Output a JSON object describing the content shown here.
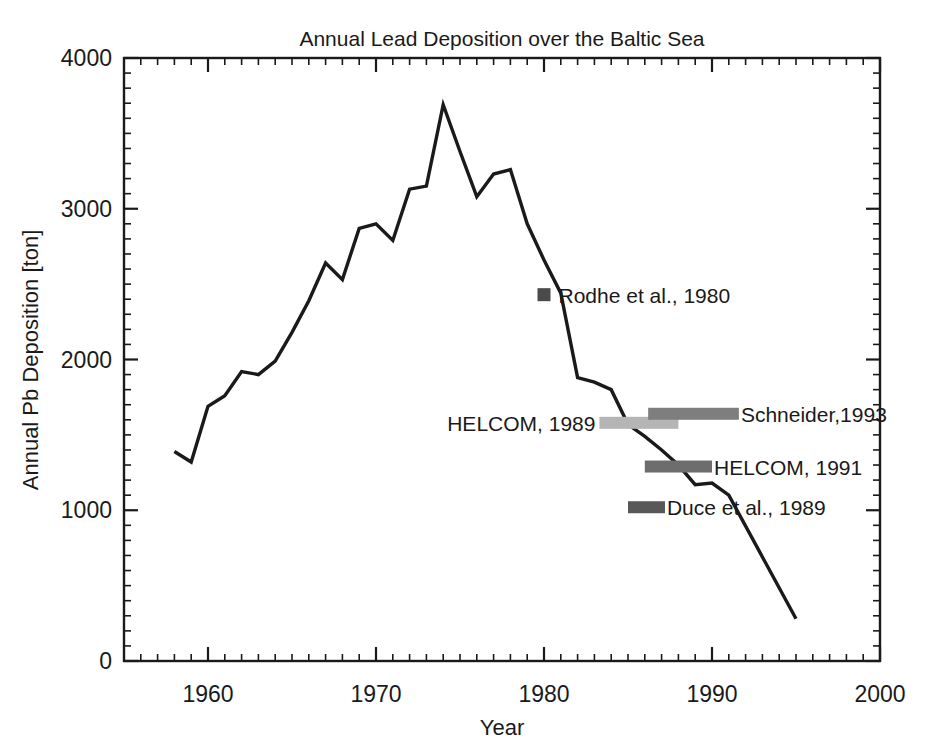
{
  "chart_data": {
    "type": "line",
    "title": "Annual Lead Deposition over the Baltic Sea",
    "xlabel": "Year",
    "ylabel": "Annual Pb Deposition [ton]",
    "xlim": [
      1955,
      2000
    ],
    "ylim": [
      0,
      4000
    ],
    "x_major_ticks": [
      1960,
      1970,
      1980,
      1990,
      2000
    ],
    "x_major_tick_labels": [
      "1960",
      "1970",
      "1980",
      "1990",
      "2000"
    ],
    "x_minor_tick_interval": 1,
    "y_major_ticks": [
      0,
      1000,
      2000,
      3000,
      4000
    ],
    "y_major_tick_labels": [
      "0",
      "1000",
      "2000",
      "3000",
      "4000"
    ],
    "y_minor_tick_interval": 100,
    "grid": false,
    "legend": "inline-annotations",
    "line_color": "#1a1a1a",
    "series": [
      {
        "name": "Annual Pb deposition",
        "x": [
          1958,
          1959,
          1960,
          1961,
          1962,
          1963,
          1964,
          1965,
          1966,
          1967,
          1968,
          1969,
          1970,
          1971,
          1972,
          1973,
          1974,
          1975,
          1976,
          1977,
          1978,
          1979,
          1980,
          1981,
          1982,
          1983,
          1984,
          1985,
          1986,
          1987,
          1988,
          1989,
          1990,
          1991,
          1995
        ],
        "values": [
          1390,
          1320,
          1690,
          1760,
          1920,
          1900,
          1990,
          2180,
          2390,
          2640,
          2530,
          2870,
          2900,
          2790,
          3130,
          3150,
          3690,
          3380,
          3080,
          3230,
          3260,
          2900,
          2660,
          2440,
          1880,
          1850,
          1800,
          1570,
          1490,
          1400,
          1300,
          1170,
          1180,
          1100,
          280
        ]
      }
    ],
    "annotations": [
      {
        "id": "rodhe-1980",
        "label": "Rodhe et al., 1980",
        "marker": "square",
        "color": "#4a4a4a",
        "x": 1980,
        "y": 2430,
        "label_side": "right"
      },
      {
        "id": "helcom-1989",
        "label": "HELCOM, 1989",
        "marker": "bar",
        "color": "#b5b5b5",
        "x_start": 1983.3,
        "x_end": 1988.0,
        "y": 1580,
        "label_side": "left"
      },
      {
        "id": "schneider-1993",
        "label": "Schneider,1993",
        "marker": "bar",
        "color": "#7e7e7e",
        "x_start": 1986.2,
        "x_end": 1991.6,
        "y": 1640,
        "label_side": "right"
      },
      {
        "id": "helcom-1991",
        "label": "HELCOM, 1991",
        "marker": "bar",
        "color": "#6d6d6d",
        "x_start": 1986.0,
        "x_end": 1990.0,
        "y": 1290,
        "label_side": "right"
      },
      {
        "id": "duce-1989",
        "label": "Duce et al., 1989",
        "marker": "bar",
        "color": "#585858",
        "x_start": 1985.0,
        "x_end": 1987.2,
        "y": 1020,
        "label_side": "right"
      }
    ]
  }
}
